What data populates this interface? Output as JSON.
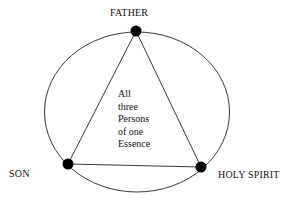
{
  "diagram": {
    "nodes": [
      {
        "id": "father",
        "label": "FATHER"
      },
      {
        "id": "son",
        "label": "SON"
      },
      {
        "id": "holy_spirit",
        "label": "HOLY SPIRIT"
      }
    ],
    "center_text": [
      "All",
      "three",
      "Persons",
      "of one",
      "Essence"
    ],
    "edges": [
      {
        "from": "father",
        "to": "son"
      },
      {
        "from": "father",
        "to": "holy_spirit"
      },
      {
        "from": "son",
        "to": "holy_spirit"
      }
    ],
    "enclosure": "ellipse",
    "colors": {
      "line": "#222222",
      "dot": "#000000",
      "background": "#ffffff"
    }
  }
}
